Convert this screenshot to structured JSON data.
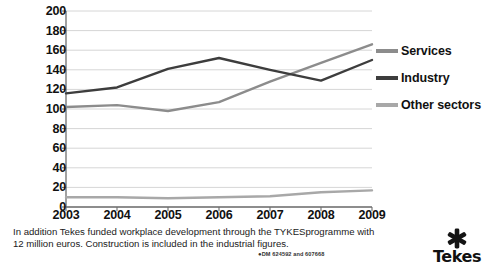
{
  "chart_data": {
    "type": "line",
    "title": "",
    "subtitle": "",
    "xlabel": "",
    "ylabel": "",
    "categories": [
      "2003",
      "2004",
      "2005",
      "2006",
      "2007",
      "2008",
      "2009"
    ],
    "x": [
      2003,
      2004,
      2005,
      2006,
      2007,
      2008,
      2009
    ],
    "ylim": [
      0,
      200
    ],
    "yticks": [
      0,
      20,
      40,
      60,
      80,
      100,
      120,
      140,
      160,
      180,
      200
    ],
    "grid": true,
    "legend_position": "right",
    "series": [
      {
        "name": "Services",
        "color": "#8c8c8c",
        "values": [
          102,
          104,
          98,
          107,
          128,
          147,
          166
        ]
      },
      {
        "name": "Industry",
        "color": "#3d3d3d",
        "values": [
          116,
          122,
          141,
          152,
          140,
          129,
          150
        ]
      },
      {
        "name": "Other sectors",
        "color": "#a8a8a8",
        "values": [
          10,
          10,
          9,
          10,
          11,
          15,
          17
        ]
      }
    ]
  },
  "axes": {
    "y_ticks": [
      "200",
      "180",
      "160",
      "140",
      "120",
      "100",
      "80",
      "60",
      "40",
      "20",
      "0"
    ],
    "x_ticks": [
      "2003",
      "2004",
      "2005",
      "2006",
      "2007",
      "2008",
      "2009"
    ]
  },
  "legend": {
    "items": [
      {
        "label": "Services",
        "color": "#8c8c8c"
      },
      {
        "label": "Industry",
        "color": "#3d3d3d"
      },
      {
        "label": "Other sectors",
        "color": "#a8a8a8"
      }
    ]
  },
  "caption": {
    "line1": "In addition Tekes funded workplace development through the TYKESprogramme with",
    "line2": "12 million euros. Construction is included in the industrial figures."
  },
  "doc_reference": {
    "bullet": "●",
    "text": "DM 624592 and 607668"
  },
  "logo": {
    "name": "Tekes",
    "icon": "asterisk-star-icon"
  },
  "colors": {
    "axis": "#6e6e6e",
    "grid": "#d6d6d6",
    "text": "#111111",
    "background": "#ffffff"
  }
}
